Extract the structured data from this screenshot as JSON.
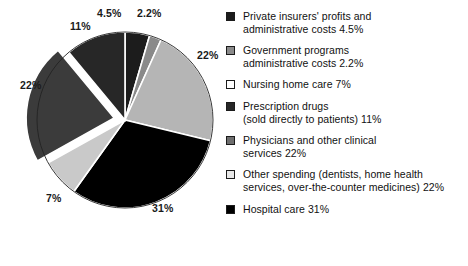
{
  "chart_data": {
    "type": "pie",
    "title": "",
    "subtitle": "",
    "xlabel": "",
    "ylabel": "",
    "grid": false,
    "legend_position": "right",
    "start_angle_deg": 0,
    "direction": "clockwise",
    "categories": [
      "Private insurers' profits and administrative costs",
      "Government programs administrative costs",
      "Physicians and other clinical services",
      "Hospital care",
      "Nursing home care",
      "Other spending (dentists, home health services, over-the-counter medicines)",
      "Prescription drugs (sold directly to patients)"
    ],
    "values": [
      4.5,
      2.2,
      22,
      31,
      7,
      22,
      11
    ],
    "value_labels": [
      "4.5%",
      "2.2%",
      "22%",
      "31%",
      "7%",
      "22%",
      "11%"
    ],
    "colors": [
      "#1c1c1c",
      "#8a8a8a",
      "#b5b5b5",
      "#000000",
      "#c9c9c9",
      "#3b3b3b",
      "#272727"
    ],
    "exploded": [
      false,
      false,
      false,
      false,
      false,
      true,
      false
    ],
    "slices": [
      {
        "label": "Private insurers' profits and administrative costs",
        "value": 4.5,
        "value_label": "4.5%",
        "color": "#1c1c1c",
        "exploded": false
      },
      {
        "label": "Government programs administrative costs",
        "value": 2.2,
        "value_label": "2.2%",
        "color": "#8a8a8a",
        "exploded": false
      },
      {
        "label": "Physicians and other clinical services",
        "value": 22,
        "value_label": "22%",
        "color": "#b5b5b5",
        "exploded": false
      },
      {
        "label": "Hospital care",
        "value": 31,
        "value_label": "31%",
        "color": "#000000",
        "exploded": false
      },
      {
        "label": "Nursing home care",
        "value": 7,
        "value_label": "7%",
        "color": "#c9c9c9",
        "exploded": false
      },
      {
        "label": "Other spending (dentists, home health services, over-the-counter medicines)",
        "value": 22,
        "value_label": "22%",
        "color": "#3b3b3b",
        "exploded": true
      },
      {
        "label": "Prescription drugs (sold directly to patients)",
        "value": 11,
        "value_label": "11%",
        "color": "#272727",
        "exploded": false
      }
    ]
  },
  "pie_labels": [
    {
      "name": "pie-pct-label-private-insurers",
      "text": "4.5%",
      "x": 97,
      "y": 8
    },
    {
      "name": "pie-pct-label-government",
      "text": "2.2%",
      "x": 137,
      "y": 8
    },
    {
      "name": "pie-pct-label-physicians",
      "text": "22%",
      "x": 197,
      "y": 50
    },
    {
      "name": "pie-pct-label-hospital",
      "text": "31%",
      "x": 152,
      "y": 203
    },
    {
      "name": "pie-pct-label-nursing",
      "text": "7%",
      "x": 46,
      "y": 193
    },
    {
      "name": "pie-pct-label-other-spending",
      "text": "22%",
      "x": 20,
      "y": 80
    },
    {
      "name": "pie-pct-label-prescription",
      "text": "11%",
      "x": 70,
      "y": 21
    }
  ],
  "legend": {
    "items": [
      {
        "swatch_color": "#1c1c1c",
        "label": "Private insurers' profits and\nadministrative costs 4.5%"
      },
      {
        "swatch_color": "#8a8a8a",
        "label": "Government programs\nadministrative costs 2.2%"
      },
      {
        "swatch_color": "#ffffff",
        "label": "Nursing home care 7%"
      },
      {
        "swatch_color": "#272727",
        "label": "Prescription drugs\n(sold directly to patients) 11%"
      },
      {
        "swatch_color": "#6e6e6e",
        "label": "Physicians and other clinical\nservices 22%"
      },
      {
        "swatch_color": "#e8e8e8",
        "label": "Other spending (dentists, home health\nservices, over-the-counter medicines) 22%"
      },
      {
        "swatch_color": "#000000",
        "label": "Hospital care 31%"
      }
    ]
  }
}
